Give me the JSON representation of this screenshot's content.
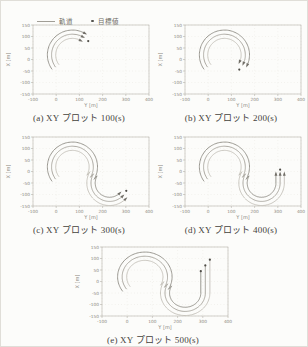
{
  "legend": {
    "trajectory_label": "軌道",
    "target_label": "目標値",
    "line_color": "#a19e96",
    "dot_color": "#55544f"
  },
  "chart_data": {
    "type": "line",
    "title": "",
    "axes": {
      "xlabel": "Y [m]",
      "ylabel": "X [m]",
      "xlim": [
        -100,
        400
      ],
      "ylim": [
        -150,
        150
      ],
      "xticks": [
        -100,
        0,
        100,
        200,
        300,
        400
      ],
      "yticks": [
        150,
        100,
        50,
        0,
        -50,
        -100,
        -150
      ],
      "grid": "dotted"
    },
    "model": {
      "circle1": {
        "center": [
          70,
          20
        ],
        "base_radius": 90,
        "from_deg": 215
      },
      "circle2": {
        "center": [
          230,
          -50
        ],
        "base_radius": 80,
        "from_deg": 150
      },
      "offsets": [
        18,
        0,
        -18
      ],
      "series_colors": [
        "#908d86",
        "#a5a29a",
        "#c3c0b8"
      ],
      "vert_tops": [
        45,
        70,
        95
      ],
      "arrow_color": "#716e67",
      "target_dot_color": "#4e4c46",
      "axis_color": "#b5b2aa",
      "tick_text_color": "#8b887f",
      "grid_color": "#e6e4dc"
    },
    "plots": [
      {
        "id": "a",
        "label": "(a) XY プロット 100(s)",
        "time_s": 100,
        "progress": {
          "a1": 60,
          "a2": null,
          "v": null
        },
        "targets": [
          [
            138,
            80
          ]
        ]
      },
      {
        "id": "b",
        "label": "(b) XY プロット 200(s)",
        "time_s": 200,
        "progress": {
          "a1": -25,
          "a2": null,
          "v": null
        },
        "targets": [
          [
            134,
            -44
          ]
        ]
      },
      {
        "id": "c",
        "label": "(c) XY プロット 300(s)",
        "time_s": 300,
        "progress": {
          "a1": -30,
          "a2": 315,
          "v": null
        },
        "targets": [
          [
            302,
            -84
          ]
        ]
      },
      {
        "id": "d",
        "label": "(d) XY プロット 400(s)",
        "time_s": 400,
        "progress": {
          "a1": -30,
          "a2": 360,
          "v": 40
        },
        "targets": [
          [
            310,
            8
          ]
        ]
      },
      {
        "id": "e",
        "label": "(e) XY プロット 500(s)",
        "time_s": 500,
        "progress": {
          "a1": -30,
          "a2": 360,
          "v": "full"
        },
        "targets": [
          [
            292,
            45
          ],
          [
            310,
            70
          ],
          [
            328,
            95
          ]
        ]
      }
    ]
  }
}
